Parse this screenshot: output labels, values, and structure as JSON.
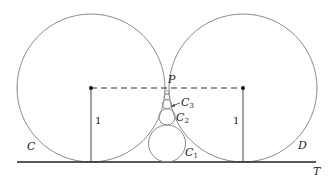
{
  "diagram": {
    "type": "geometry",
    "labels": {
      "circle_left": "C",
      "circle_right": "D",
      "line": "T",
      "tangent_point": "P",
      "c1_main": "C",
      "c1_sub": "1",
      "c2_main": "C",
      "c2_sub": "2",
      "c3_main": "C",
      "c3_sub": "3",
      "radius_left": "1",
      "radius_right": "1"
    },
    "colors": {
      "circle_stroke": "#8a8a8a",
      "line_stroke": "#222222",
      "dash_stroke": "#333333"
    }
  }
}
